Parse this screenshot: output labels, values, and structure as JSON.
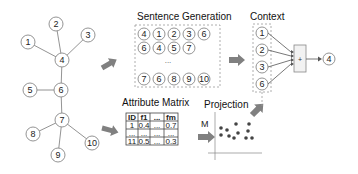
{
  "graph": {
    "nodes": [
      {
        "id": "1",
        "x": 28,
        "y": 42
      },
      {
        "id": "2",
        "x": 56,
        "y": 24
      },
      {
        "id": "3",
        "x": 88,
        "y": 35
      },
      {
        "id": "4",
        "x": 62,
        "y": 60
      },
      {
        "id": "5",
        "x": 30,
        "y": 90
      },
      {
        "id": "6",
        "x": 61,
        "y": 90
      },
      {
        "id": "7",
        "x": 62,
        "y": 120
      },
      {
        "id": "8",
        "x": 33,
        "y": 134
      },
      {
        "id": "9",
        "x": 58,
        "y": 155
      },
      {
        "id": "10",
        "x": 92,
        "y": 143
      }
    ],
    "edges": [
      [
        "1",
        "4"
      ],
      [
        "2",
        "4"
      ],
      [
        "3",
        "4"
      ],
      [
        "4",
        "6"
      ],
      [
        "5",
        "6"
      ],
      [
        "6",
        "7"
      ],
      [
        "7",
        "8"
      ],
      [
        "7",
        "9"
      ],
      [
        "7",
        "10"
      ]
    ]
  },
  "sentence_generation": {
    "title": "Sentence Generation",
    "rows": [
      [
        "4",
        "1",
        "2",
        "3",
        "6"
      ],
      [
        "6",
        "4",
        "5",
        "7"
      ],
      [
        "7",
        "6",
        "8",
        "9",
        "10"
      ]
    ],
    "ellipsis": "..."
  },
  "context": {
    "title": "Context",
    "inputs": [
      "1",
      "2",
      "3",
      "6"
    ],
    "operator": "+",
    "output": "4"
  },
  "attribute_matrix": {
    "title": "Attribute Matrix",
    "headers": [
      "ID",
      "f1",
      "...",
      "fm"
    ],
    "rows": [
      [
        "1",
        "0.4",
        "...",
        "0.7"
      ],
      [
        "...",
        "...",
        "...",
        "..."
      ],
      [
        "11",
        "0.5",
        "...",
        "0.3"
      ]
    ]
  },
  "projection": {
    "title": "Projection",
    "arrow_label": "M",
    "points": [
      [
        221,
        128
      ],
      [
        227,
        130
      ],
      [
        221,
        135
      ],
      [
        229,
        136
      ],
      [
        236,
        124
      ],
      [
        238,
        133
      ],
      [
        234,
        138
      ],
      [
        249,
        124
      ],
      [
        248,
        131
      ],
      [
        246,
        138
      ],
      [
        252,
        138
      ]
    ]
  }
}
